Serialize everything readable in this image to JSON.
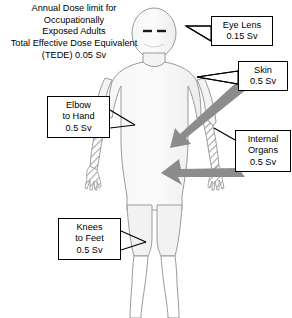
{
  "diagram": {
    "type": "annotated-body-silhouette",
    "title": {
      "line1": "Annual Dose limit for",
      "line2": "Occupationally",
      "line3": "Exposed Adults",
      "line4": "Total Effective Dose Equivalent",
      "line5": "(TEDE) 0.05 Sv"
    },
    "callouts": [
      {
        "id": "eye-lens",
        "region": "Eye Lens",
        "line1": "Eye Lens",
        "line2": "0.15 Sv",
        "value": 0.15,
        "unit": "Sv",
        "target": "head-eyes"
      },
      {
        "id": "skin",
        "region": "Skin",
        "line1": "Skin",
        "line2": "0.5 Sv",
        "value": 0.5,
        "unit": "Sv",
        "target": "shoulder"
      },
      {
        "id": "elbow-to-hand",
        "region": "Elbow to Hand",
        "line1": "Elbow",
        "line2": "to Hand",
        "line3": "0.5 Sv",
        "value": 0.5,
        "unit": "Sv",
        "target": "left-forearm"
      },
      {
        "id": "internal-organs",
        "region": "Internal Organs",
        "line1": "Internal",
        "line2": "Organs",
        "line3": "0.5 Sv",
        "value": 0.5,
        "unit": "Sv",
        "target": "torso"
      },
      {
        "id": "knees-to-feet",
        "region": "Knees to Feet",
        "line1": "Knees",
        "line2": "to Feet",
        "line3": "0.5 Sv",
        "value": 0.5,
        "unit": "Sv",
        "target": "lower-legs"
      }
    ],
    "figure": {
      "body_fill": "#f2f2f2",
      "body_stroke": "#9a9a9a",
      "hatch_color": "#a8a8a8",
      "arrow_color": "#8c8c8c",
      "leader_color": "#000000",
      "box_border": "#000000",
      "background": "#ffffff",
      "hatched_regions": [
        "left-forearm-and-hand",
        "right-forearm-and-hand"
      ],
      "arrows": [
        {
          "id": "arrow-skin",
          "from": "skin-callout",
          "to": "right-shoulder"
        },
        {
          "id": "arrow-internal-organs",
          "from": "internal-organs-callout",
          "to": "abdomen"
        }
      ]
    }
  }
}
